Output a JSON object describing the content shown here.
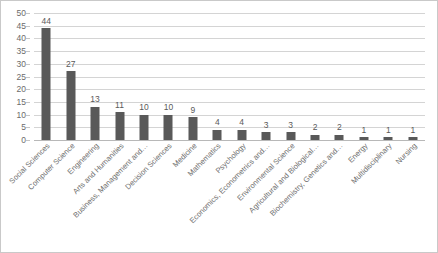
{
  "chart_data": {
    "type": "bar",
    "title": "",
    "subtitle": "",
    "xlabel": "",
    "ylabel": "",
    "ylim": [
      0,
      50
    ],
    "ytick_step": 5,
    "yticks": [
      50,
      45,
      40,
      35,
      30,
      25,
      20,
      15,
      10,
      5,
      0
    ],
    "grid": true,
    "legend": false,
    "bar_color": "#595959",
    "gridline_color": "#d4d4d4",
    "label_color": "#6e6e6e",
    "categories": [
      "Social Sciences",
      "Computer Science",
      "Engineering",
      "Arts and Humanities",
      "Business, Management and…",
      "Decision Sciences",
      "Medicine",
      "Mathematics",
      "Psychology",
      "Economics, Econometrics and…",
      "Environmental Science",
      "Agricultural and Biological…",
      "Biochemistry, Genetics and…",
      "Energy",
      "Multidisciplinary",
      "Nursing"
    ],
    "values": [
      44,
      27,
      13,
      11,
      10,
      10,
      9,
      4,
      4,
      3,
      3,
      2,
      2,
      1,
      1,
      1
    ],
    "data_labels": [
      "44",
      "27",
      "13",
      "11",
      "10",
      "10",
      "9",
      "4",
      "4",
      "3",
      "3",
      "2",
      "2",
      "1",
      "1",
      "1"
    ]
  }
}
